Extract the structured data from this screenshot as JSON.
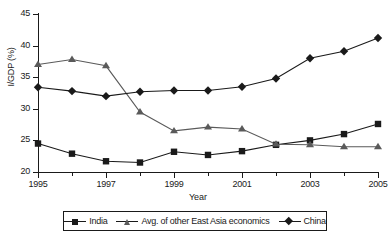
{
  "chart_data": {
    "type": "line",
    "title": "",
    "xlabel": "Year",
    "ylabel": "I/GDP (%)",
    "x": [
      1995,
      1996,
      1997,
      1998,
      1999,
      2000,
      2001,
      2002,
      2003,
      2004,
      2005
    ],
    "xlim": [
      1995,
      2005
    ],
    "ylim": [
      20,
      45
    ],
    "yticks": [
      20,
      25,
      30,
      35,
      40,
      45
    ],
    "xticks_major": [
      1995,
      1997,
      1999,
      2001,
      2003,
      2005
    ],
    "xticks_minor": [
      1996,
      1998,
      2000,
      2002,
      2004
    ],
    "grid": false,
    "legend_position": "bottom",
    "series": [
      {
        "name": "India",
        "marker": "square",
        "color": "#1a1a1a",
        "values": [
          24.5,
          22.9,
          21.7,
          21.5,
          23.2,
          22.7,
          23.3,
          24.3,
          25.0,
          26.0,
          27.6
        ]
      },
      {
        "name": "Avg. of other East Asia economics",
        "marker": "triangle",
        "color": "#5a5a5a",
        "values": [
          37.0,
          37.8,
          36.8,
          29.5,
          26.5,
          27.1,
          26.8,
          24.4,
          24.3,
          24.0,
          24.0
        ]
      },
      {
        "name": "China",
        "marker": "diamond",
        "color": "#1a1a1a",
        "values": [
          33.4,
          32.8,
          32.0,
          32.7,
          32.9,
          32.9,
          33.5,
          34.8,
          38.0,
          39.1,
          41.2
        ]
      }
    ]
  },
  "axes": {
    "y_title": "I/GDP (%)",
    "x_title": "Year",
    "y_tick_labels": [
      "20",
      "25",
      "30",
      "35",
      "40",
      "45"
    ],
    "x_tick_labels": [
      "1995",
      "1997",
      "1999",
      "2001",
      "2003",
      "2005"
    ]
  },
  "legend": {
    "entries": [
      {
        "label": "India",
        "marker": "square-marker"
      },
      {
        "label": "Avg. of other East Asia economics",
        "marker": "triangle-marker"
      },
      {
        "label": "China",
        "marker": "diamond-marker"
      }
    ]
  }
}
